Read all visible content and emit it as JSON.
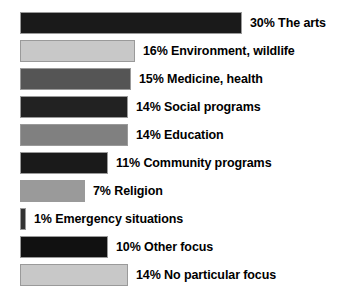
{
  "chart_data": {
    "type": "bar",
    "orientation": "horizontal",
    "title": "",
    "subtitle": "",
    "xlabel": "",
    "ylabel": "",
    "grid": false,
    "legend": "none",
    "axis_visible": false,
    "value_unit": "%",
    "categories": [
      "The arts",
      "Environment, wildlife",
      "Medicine, health",
      "Social programs",
      "Education",
      "Community programs",
      "Religion",
      "Emergency situations",
      "Other focus",
      "No particular focus"
    ],
    "values": [
      30,
      16,
      15,
      14,
      14,
      11,
      7,
      1,
      10,
      14
    ],
    "labels": [
      "30% The arts",
      "16% Environment, wildlife",
      "15% Medicine, health",
      "14% Social programs",
      "14% Education",
      "11% Community programs",
      "7% Religion",
      "1% Emergency situations",
      "10% Other focus",
      "14% No particular focus"
    ],
    "bar_colors": [
      "#1a1a1a",
      "#c8c8c8",
      "#555555",
      "#222222",
      "#808080",
      "#1a1a1a",
      "#9a9a9a",
      "#333333",
      "#111111",
      "#c8c8c8"
    ],
    "bar_pixel_widths": [
      222,
      115,
      111,
      108,
      108,
      88,
      65,
      6,
      88,
      108
    ],
    "bar_pixel_tops": [
      12,
      40,
      68,
      96,
      124,
      152,
      180,
      208,
      236,
      264
    ]
  }
}
